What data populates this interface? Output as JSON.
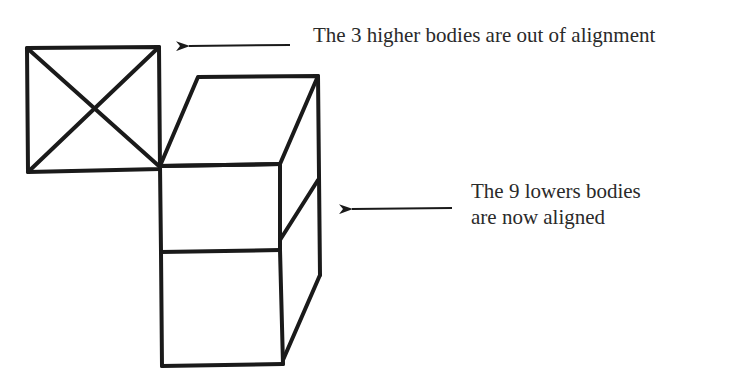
{
  "diagram": {
    "title": "",
    "colors": {
      "stroke": "#1a1a1a",
      "text": "#2a2a2a",
      "background": "#ffffff"
    },
    "annotations": [
      {
        "id": "higher-bodies",
        "text": "The 3 higher bodies are out of alignment",
        "points_to": "left-square-face"
      },
      {
        "id": "lower-bodies",
        "line1": "The 9 lowers bodies",
        "line2": "are now aligned",
        "points_to": "stacked-cube-front"
      }
    ],
    "shapes": [
      {
        "id": "left-square-face",
        "label": "misaligned top layer face (crossed square)"
      },
      {
        "id": "top-parallelogram",
        "label": "top face of aligned column"
      },
      {
        "id": "front-upper-box",
        "label": "upper front face of aligned column"
      },
      {
        "id": "front-lower-box",
        "label": "lower front face of aligned column"
      },
      {
        "id": "right-side-face",
        "label": "right side face of aligned column"
      }
    ]
  }
}
